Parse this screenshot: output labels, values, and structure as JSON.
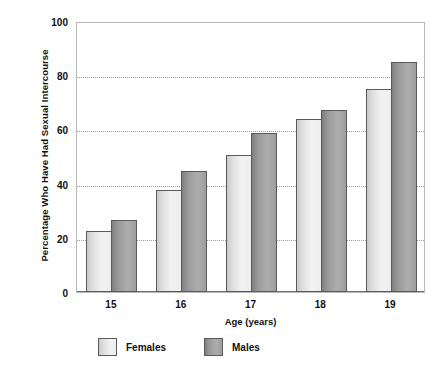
{
  "chart_data": {
    "type": "bar",
    "title": "",
    "xlabel": "Age (years)",
    "ylabel": "Percentage Who Have Had Sexual Intercourse",
    "categories": [
      "15",
      "16",
      "17",
      "18",
      "19"
    ],
    "series": [
      {
        "name": "Females",
        "values": [
          22.5,
          37.5,
          50.5,
          64,
          75
        ],
        "color": "#e8e8e8"
      },
      {
        "name": "Males",
        "values": [
          26.5,
          44.5,
          58.5,
          67,
          85
        ],
        "color": "#9b9b9b"
      }
    ],
    "ylim": [
      0,
      100
    ],
    "yticks": [
      "0",
      "20",
      "40",
      "60",
      "80",
      "100"
    ],
    "ytick_values": [
      0,
      20,
      40,
      60,
      80,
      100
    ],
    "gridlines": [
      20,
      40,
      60,
      80
    ],
    "grid": true,
    "legend_position": "bottom-left",
    "legend": [
      {
        "label": "Females",
        "swatch": "female"
      },
      {
        "label": "Males",
        "swatch": "male"
      }
    ]
  }
}
